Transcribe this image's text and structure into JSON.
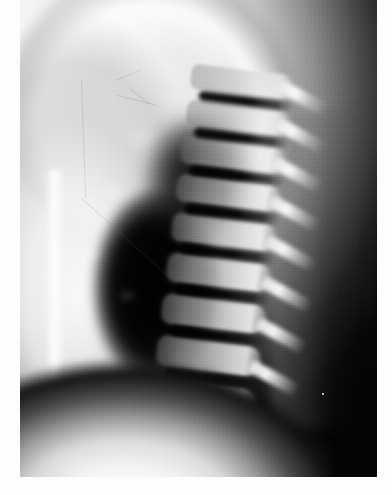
{
  "image": {
    "kind": "radiograph",
    "modality": "X-ray",
    "view": "lateral",
    "body_region": "thoracic spine / chest",
    "orientation": "anterior-left, posterior-right",
    "color_mode": "grayscale",
    "width_px": 392,
    "height_px": 495,
    "alt_text": "Black and white lateral chest and thoracic spine radiograph showing vertebral bodies, intervertebral disc spaces and dark lung field",
    "title": ""
  },
  "film": {
    "left_px": 20,
    "top_px": 0,
    "width_px": 357,
    "height_px": 477,
    "background_color": "#040404"
  },
  "page": {
    "background_color": "#ffffff",
    "margins": {
      "left_px": 20,
      "right_px": 15,
      "bottom_px": 18,
      "top_px": 0,
      "color": "#fdfdfd"
    }
  },
  "palette": {
    "black_field": "#040404",
    "deep_shadow": "#000000",
    "bone_bright": "#f7f7f7",
    "soft_tissue_mid": "#9a9a9a",
    "soft_tissue_light": "#e6e6e6",
    "disc_dark": "#0a0a0a",
    "margin_white": "#fdfdfd"
  },
  "anatomy": {
    "soft_tissue_mass": {
      "label": "anterior chest wall / shoulder soft tissue",
      "location": "upper-left quadrant",
      "density": "high"
    },
    "body_contour": {
      "label": "superior body contour",
      "path": "sweeps from upper-left downward to the right"
    },
    "lung_field": {
      "label": "dark lung field",
      "location": "center / center-left",
      "density": "very low"
    },
    "diaphragm_base": {
      "label": "diaphragm and upper abdomen",
      "location": "bottom band",
      "density": "high"
    },
    "sternum": {
      "label": "sternum / anterior column",
      "location": "left, vertical bright strip"
    },
    "posterior_elements": {
      "label": "spinous processes / posterior elements",
      "location": "right of vertebral bodies"
    }
  },
  "spine": {
    "label": "thoracic vertebral column (lateral projection)",
    "tilt_deg": 7,
    "vertebrae": [
      {
        "id": "V1",
        "top": 0,
        "height": 25,
        "brightness": 0.72
      },
      {
        "id": "V2",
        "top": 36,
        "height": 26,
        "brightness": 0.78
      },
      {
        "id": "V3",
        "top": 73,
        "height": 27,
        "brightness": 0.84
      },
      {
        "id": "V4",
        "top": 111,
        "height": 27,
        "brightness": 0.88
      },
      {
        "id": "V5",
        "top": 150,
        "height": 28,
        "brightness": 0.9
      },
      {
        "id": "V6",
        "top": 190,
        "height": 29,
        "brightness": 0.92
      },
      {
        "id": "V7",
        "top": 231,
        "height": 30,
        "brightness": 0.9
      },
      {
        "id": "V8",
        "top": 273,
        "height": 31,
        "brightness": 0.86
      },
      {
        "id": "V9",
        "top": 316,
        "height": 32,
        "brightness": 0.8
      }
    ],
    "discs": [
      {
        "id": "D1",
        "top": 26,
        "height": 10
      },
      {
        "id": "D2",
        "top": 63,
        "height": 10
      },
      {
        "id": "D3",
        "top": 101,
        "height": 10
      },
      {
        "id": "D4",
        "top": 139,
        "height": 11
      },
      {
        "id": "D5",
        "top": 179,
        "height": 11
      },
      {
        "id": "D6",
        "top": 220,
        "height": 11
      },
      {
        "id": "D7",
        "top": 262,
        "height": 11
      },
      {
        "id": "D8",
        "top": 305,
        "height": 11
      }
    ],
    "spinous_processes": [
      {
        "id": "S1",
        "left": 86,
        "top": 14
      },
      {
        "id": "S2",
        "left": 88,
        "top": 52
      },
      {
        "id": "S3",
        "left": 90,
        "top": 91
      },
      {
        "id": "S4",
        "left": 92,
        "top": 130
      },
      {
        "id": "S5",
        "left": 93,
        "top": 170
      },
      {
        "id": "S6",
        "left": 94,
        "top": 211
      },
      {
        "id": "S7",
        "left": 94,
        "top": 253
      },
      {
        "id": "S8",
        "left": 92,
        "top": 296
      },
      {
        "id": "S9",
        "left": 88,
        "top": 339
      }
    ]
  },
  "artifacts": {
    "scratches": [
      {
        "id": "scratch-1",
        "left": 62,
        "top": 80,
        "length": 118,
        "angle": 88,
        "thickness": 1,
        "opacity": 0.32
      },
      {
        "id": "scratch-2",
        "left": 62,
        "top": 198,
        "length": 120,
        "angle": 42,
        "thickness": 1,
        "opacity": 0.3
      },
      {
        "id": "scratch-3",
        "left": 98,
        "top": 95,
        "length": 40,
        "angle": 14,
        "thickness": 1,
        "opacity": 0.38
      },
      {
        "id": "scratch-4",
        "left": 110,
        "top": 88,
        "length": 26,
        "angle": 38,
        "thickness": 1,
        "opacity": 0.3
      },
      {
        "id": "scratch-5",
        "left": 95,
        "top": 80,
        "length": 28,
        "angle": -22,
        "thickness": 1,
        "opacity": 0.26
      }
    ],
    "dust_speck": {
      "id": "dust-speck",
      "left": 302,
      "top": 393
    }
  }
}
